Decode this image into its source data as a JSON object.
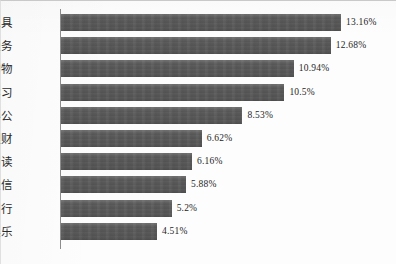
{
  "chart_data": {
    "type": "bar",
    "orientation": "horizontal",
    "title": "",
    "subtitle": "",
    "xlabel": "",
    "ylabel": "",
    "unit": "%",
    "grid": false,
    "legend": null,
    "xlim": [
      0,
      13.16
    ],
    "axis_origin": 0,
    "categories": [
      "实用工具",
      "生活服务",
      "时尚购物",
      "教育学习",
      "商务办公",
      "金融理财",
      "新闻阅读",
      "社交通信",
      "旅游出行",
      "游戏娱乐"
    ],
    "values": [
      13.16,
      12.68,
      10.94,
      10.5,
      8.53,
      6.62,
      6.16,
      5.88,
      5.2,
      4.51
    ],
    "value_labels": [
      "13.16%",
      "12.68%",
      "10.94%",
      "10.5%",
      "8.53%",
      "6.62%",
      "6.16%",
      "5.88%",
      "5.2%",
      "4.51%"
    ],
    "bar_color": "#595959",
    "background_color": "#ffffff",
    "axis_color": "#8d8d8d"
  }
}
